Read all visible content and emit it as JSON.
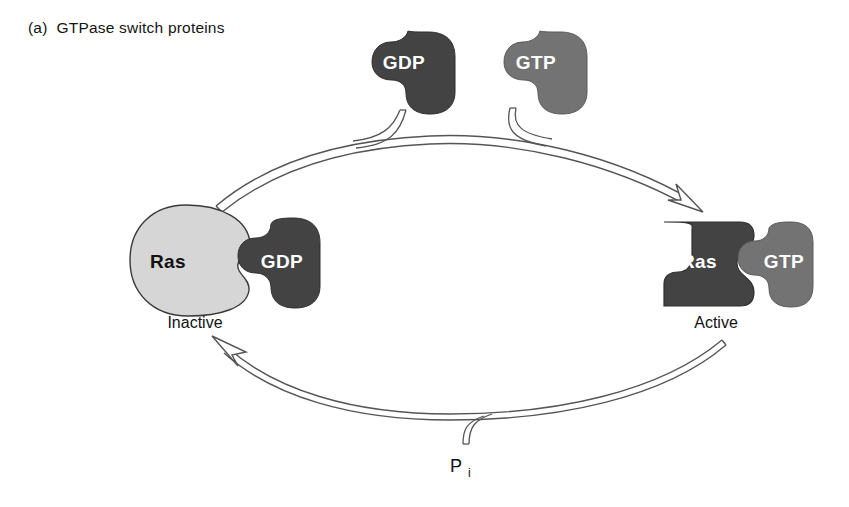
{
  "figure": {
    "panel_tag": "(a)",
    "panel_title": "GTPase switch proteins",
    "background_color": "#ffffff",
    "outline_color": "#555555"
  },
  "nucleotides": {
    "incoming": {
      "label": "GTP",
      "color": "#737373",
      "role": "binds-to-ras",
      "x": 536,
      "y": 70
    },
    "released": {
      "label": "GDP",
      "color": "#434343",
      "role": "released-from-ras",
      "x": 404,
      "y": 70
    }
  },
  "complexes": {
    "inactive": {
      "protein_label": "Ras",
      "protein_color": "#d6d6d6",
      "protein_text_color": "#111111",
      "nucleotide_label": "GDP",
      "nucleotide_color": "#434343",
      "state_label": "Inactive",
      "state_x": 195,
      "state_y": 322
    },
    "active": {
      "protein_label": "Ras",
      "protein_color": "#434343",
      "protein_text_color": "#ffffff",
      "nucleotide_label": "GTP",
      "nucleotide_color": "#737373",
      "state_label": "Active",
      "state_x": 716,
      "state_y": 322
    }
  },
  "byproduct": {
    "label": "P",
    "subscript": "i",
    "x": 463,
    "y": 466
  },
  "arrows": {
    "top": {
      "name": "activation-arrow",
      "direction": "inactive-to-active",
      "style": "open-outline"
    },
    "bottom": {
      "name": "hydrolysis-arrow",
      "direction": "active-to-inactive",
      "style": "open-outline"
    }
  }
}
